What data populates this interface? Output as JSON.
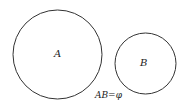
{
  "diagram": {
    "type": "venn",
    "sets": [
      {
        "label": "A",
        "cx": 57.5,
        "cy": 54.5,
        "r": 44.5
      },
      {
        "label": "B",
        "cx": 145.5,
        "cy": 63.5,
        "r": 30.5
      }
    ],
    "relation_label": "AB=φ",
    "stroke_color": "#333333",
    "background": "#ffffff"
  }
}
